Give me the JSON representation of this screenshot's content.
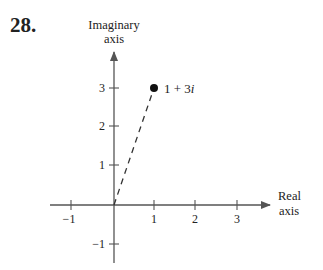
{
  "problem": {
    "number": "28."
  },
  "axes": {
    "imaginary": {
      "label_line1": "Imaginary",
      "label_line2": "axis"
    },
    "real": {
      "label_line1": "Real",
      "label_line2": "axis"
    }
  },
  "ticks": {
    "x": [
      {
        "label": "−1",
        "value": -1
      },
      {
        "label": "1",
        "value": 1
      },
      {
        "label": "2",
        "value": 2
      },
      {
        "label": "3",
        "value": 3
      }
    ],
    "y": [
      {
        "label": "3",
        "value": 3
      },
      {
        "label": "2",
        "value": 2
      },
      {
        "label": "1",
        "value": 1
      },
      {
        "label": "−1",
        "value": -1
      }
    ]
  },
  "point": {
    "label_prefix": "1 + 3",
    "label_imag": "i",
    "re": 1,
    "im": 3
  },
  "colors": {
    "ink": "#222222",
    "axis": "#555555"
  }
}
